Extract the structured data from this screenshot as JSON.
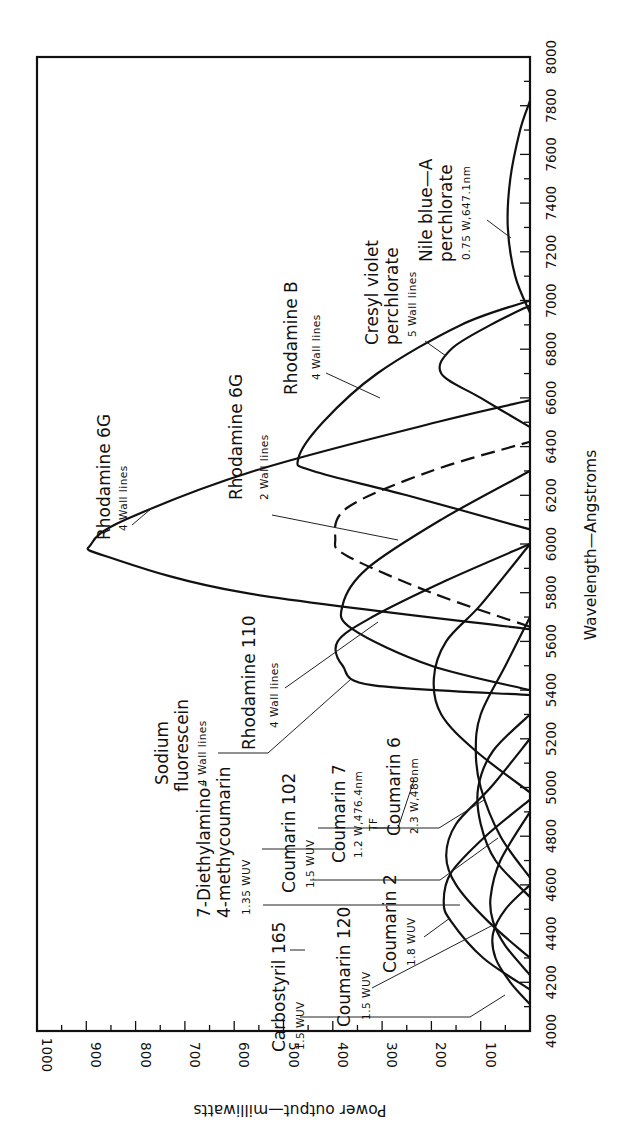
{
  "chart_data": {
    "type": "line",
    "title": "",
    "xlabel": "Wavelength—Angstroms",
    "ylabel": "Power output—milliwatts",
    "xlim": [
      4000,
      8000
    ],
    "ylim": [
      0,
      1000
    ],
    "x_ticks": [
      4000,
      4200,
      4400,
      4600,
      4800,
      5000,
      5200,
      5400,
      5600,
      5800,
      6000,
      6200,
      6400,
      6600,
      6800,
      7000,
      7200,
      7400,
      7600,
      7800,
      8000
    ],
    "y_ticks": [
      100,
      200,
      300,
      400,
      500,
      600,
      700,
      800,
      900,
      1000
    ],
    "grid": false,
    "orientation": "rotated 90° counter-clockwise (wavelength increases upward, power increases leftward)",
    "series": [
      {
        "name": "Carbostyril 165",
        "note": "1.5 WUV",
        "style": "solid",
        "x": [
          4110,
          4200,
          4300,
          4400,
          4500,
          4600
        ],
        "y": [
          0,
          40,
          70,
          75,
          50,
          0
        ]
      },
      {
        "name": "Coumarin 120",
        "note": "1.5 WUV",
        "style": "solid",
        "x": [
          4230,
          4350,
          4450,
          4550,
          4700,
          4900
        ],
        "y": [
          0,
          50,
          75,
          80,
          60,
          0
        ]
      },
      {
        "name": "Coumarin 2",
        "note": "1.8 WUV",
        "style": "solid",
        "x": [
          4170,
          4300,
          4450,
          4530,
          4650,
          4800,
          4950
        ],
        "y": [
          0,
          95,
          160,
          175,
          160,
          90,
          0
        ]
      },
      {
        "name": "7-Diethylamino-4-methycoumarin",
        "note": "1.35 WUV",
        "style": "solid",
        "x": [
          4300,
          4450,
          4600,
          4720,
          4850,
          5000,
          5200
        ],
        "y": [
          0,
          85,
          150,
          170,
          150,
          80,
          0
        ]
      },
      {
        "name": "Coumarin 102",
        "note": "1.5 WUV",
        "style": "solid",
        "x": [
          4550,
          4700,
          4850,
          5000,
          5150,
          5300
        ],
        "y": [
          0,
          70,
          100,
          105,
          75,
          0
        ]
      },
      {
        "name": "Coumarin 7",
        "note": "1.2 W, 476.4nm TF",
        "style": "solid",
        "x": [
          4630,
          4800,
          5000,
          5150,
          5300,
          5500,
          5700
        ],
        "y": [
          0,
          60,
          100,
          110,
          100,
          50,
          0
        ]
      },
      {
        "name": "Coumarin 6",
        "note": "2.3 W, 488nm",
        "style": "solid",
        "x": [
          4980,
          5150,
          5300,
          5450,
          5600,
          5750,
          6000
        ],
        "y": [
          0,
          110,
          180,
          195,
          170,
          100,
          0
        ]
      },
      {
        "name": "Sodium fluorescein",
        "note": "4 Wall lines",
        "style": "solid",
        "x": [
          5380,
          5420,
          5500,
          5600,
          5700,
          5850,
          6000
        ],
        "y": [
          0,
          320,
          380,
          390,
          320,
          170,
          0
        ]
      },
      {
        "name": "Rhodamine 110",
        "note": "4 Wall lines",
        "style": "solid",
        "x": [
          5400,
          5500,
          5650,
          5750,
          5900,
          6100,
          6300
        ],
        "y": [
          0,
          200,
          360,
          380,
          330,
          180,
          0
        ]
      },
      {
        "name": "Rhodamine 6G",
        "note": "4 Wall lines",
        "style": "solid",
        "x": [
          5650,
          5800,
          5950,
          6000,
          6100,
          6300,
          6500,
          6590
        ],
        "y": [
          0,
          580,
          860,
          890,
          820,
          560,
          190,
          0
        ]
      },
      {
        "name": "Rhodamine 6G",
        "note": "2 Wall lines",
        "style": "dashed",
        "x": [
          5660,
          5800,
          5950,
          6020,
          6150,
          6300,
          6420
        ],
        "y": [
          0,
          200,
          370,
          395,
          370,
          200,
          0
        ]
      },
      {
        "name": "Rhodamine B",
        "note": "4 Wall lines",
        "style": "solid",
        "x": [
          6060,
          6200,
          6300,
          6350,
          6500,
          6700,
          6900,
          7000
        ],
        "y": [
          0,
          250,
          440,
          470,
          420,
          310,
          140,
          0
        ]
      },
      {
        "name": "Cresyl violet perchlorate",
        "note": "5 Wall lines",
        "style": "solid",
        "x": [
          6480,
          6600,
          6700,
          6800,
          6900,
          6980
        ],
        "y": [
          0,
          100,
          180,
          160,
          80,
          0
        ]
      },
      {
        "name": "Nile blue-A perchlorate",
        "note": "0.75 W, 647.1nm",
        "style": "solid",
        "x": [
          6950,
          7100,
          7300,
          7500,
          7700,
          7820
        ],
        "y": [
          0,
          30,
          45,
          40,
          20,
          0
        ]
      }
    ],
    "annotations": [
      {
        "label": "Rhodamine 6G",
        "sub": "4 Wall lines"
      },
      {
        "label": "Rhodamine 6G",
        "sub": "2 Wall lines"
      },
      {
        "label": "Rhodamine B",
        "sub": "4 Wall lines"
      },
      {
        "label": "Cresyl violet perchlorate",
        "sub": "5 Wall lines"
      },
      {
        "label": "Nile blue—A perchlorate",
        "sub": "0.75 W,647.1nm"
      },
      {
        "label": "Rhodamine 110",
        "sub": "4 Wall lines"
      },
      {
        "label": "Sodium fluorescein",
        "sub": "4 Wall lines"
      },
      {
        "label": "Coumarin 102",
        "sub": "1.5 WUV"
      },
      {
        "label": "Coumarin 7",
        "sub": "1.2 W,476.4nm TF"
      },
      {
        "label": "Coumarin 6",
        "sub": "2.3 W,488nm"
      },
      {
        "label": "7-Diethylamino-4-methycoumarin",
        "sub": "1.35 WUV"
      },
      {
        "label": "Carbostyril 165",
        "sub": "1.5 WUV"
      },
      {
        "label": "Coumarin 120",
        "sub": "1.5 WUV"
      },
      {
        "label": "Coumarin 2",
        "sub": "1.8 WUV"
      }
    ]
  },
  "labels": {
    "xlabel": "Wavelength—Angstroms",
    "ylabel": "Power output—milliwatts",
    "rh6g4_main": "Rhodamine 6G",
    "rh6g4_sub": "4 Wall lines",
    "rh6g2_main": "Rhodamine 6G",
    "rh6g2_sub": "2 Wall lines",
    "rhb_main": "Rhodamine B",
    "rhb_sub": "4 Wall lines",
    "cv_main1": "Cresyl violet",
    "cv_main2": "perchlorate",
    "cv_sub": "5 Wall lines",
    "nb_main1": "Nile blue—A",
    "nb_main2": "perchlorate",
    "nb_sub": "0.75 W,647.1nm",
    "rh110_main": "Rhodamine 110",
    "rh110_sub": "4 Wall lines",
    "sf_main1": "Sodium",
    "sf_main2": "fluorescein",
    "sf_sub": "4 Wall lines",
    "c102_main": "Coumarin 102",
    "c102_sub": "1.5 WUV",
    "c7_main": "Coumarin 7",
    "c7_sub1": "1.2 W,476.4nm",
    "c7_sub2": "TF",
    "c6_main": "Coumarin 6",
    "c6_sub": "2.3 W,488nm",
    "dea_main1": "7-Diethylamino-",
    "dea_main2": "4-methycoumarin",
    "dea_sub": "1.35 WUV",
    "cs165_main": "Carbostyril 165",
    "cs165_sub": "1.5 WUV",
    "c120_main": "Coumarin 120",
    "c120_sub": "1.5 WUV",
    "c2_main": "Coumarin 2",
    "c2_sub": "1.8 WUV"
  }
}
